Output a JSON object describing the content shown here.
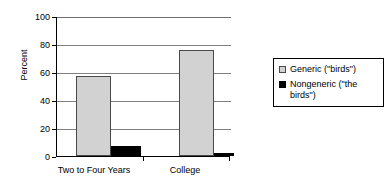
{
  "chart_data": {
    "type": "bar",
    "title": "",
    "xlabel": "",
    "ylabel": "Percent",
    "ylim": [
      0,
      100
    ],
    "yticks": [
      0,
      20,
      40,
      60,
      80,
      100
    ],
    "ytick_labels": [
      "0",
      "20",
      "40",
      "60",
      "80",
      "100"
    ],
    "grid": true,
    "legend_position": "right",
    "categories": [
      "Two to Four Years",
      "College"
    ],
    "series": [
      {
        "name": "Generic (\"birds\")",
        "color": "#d2d2d2",
        "border_color": "#4a4a4a",
        "values": [
          57.5,
          76.5
        ]
      },
      {
        "name": "Nongeneric (\"the birds\")",
        "color": "#000000",
        "border_color": "#000000",
        "values": [
          7,
          2
        ]
      }
    ]
  },
  "legend": {
    "entries": [
      {
        "label": "Generic (\"birds\")"
      },
      {
        "label": "Nongeneric (\"the birds\")"
      }
    ]
  },
  "axis": {
    "y_title": "Percent",
    "tick_100": "100",
    "tick_80": "80",
    "tick_60": "60",
    "tick_40": "40",
    "tick_20": "20",
    "tick_0": "0",
    "x_cat_0": "Two to Four Years",
    "x_cat_1": "College"
  }
}
